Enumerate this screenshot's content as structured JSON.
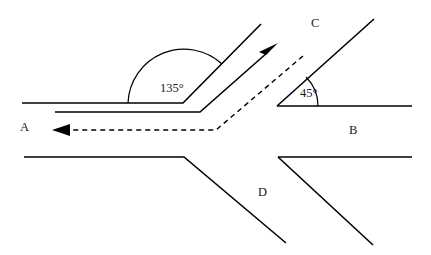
{
  "figure": {
    "type": "geometry-diagram",
    "background_color": "#ffffff",
    "stroke_color": "#000000",
    "width": 431,
    "height": 255
  },
  "angles": [
    {
      "id": "angle-135",
      "label": "135°",
      "value": 135,
      "unit": "degrees",
      "vertex": [
        183,
        103
      ],
      "label_position": [
        160,
        92
      ],
      "arc_radius": 56
    },
    {
      "id": "angle-45",
      "label": "45°",
      "value": 45,
      "unit": "degrees",
      "vertex": [
        277,
        106
      ],
      "label_position": [
        300,
        97
      ],
      "arc_radius": 40
    }
  ],
  "region_labels": [
    {
      "id": "label-a",
      "text": "A",
      "x": 20,
      "y": 131
    },
    {
      "id": "label-b",
      "text": "B",
      "x": 349,
      "y": 134
    },
    {
      "id": "label-c",
      "text": "C",
      "x": 311,
      "y": 27
    },
    {
      "id": "label-d",
      "text": "D",
      "x": 258,
      "y": 196
    }
  ],
  "paths": {
    "upper_left_bent_line": "M 22 103 L 183 103 L 261 24",
    "second_bent_line": "M 55 112 L 200 112 L 268 52",
    "lower_left_line": "M 24 157 L 184 157 L 286 243",
    "right_horizontal_line": "M 277 106 L 412 106",
    "right_upper_diagonal": "M 277 106 L 374 19",
    "right_lower_horizontal": "M 278 157 L 412 157",
    "right_lower_diagonal": "M 278 157 L 373 245",
    "dashed_path": "M 303 56 L 216 130 L 62 130",
    "arc_135": "M 128 103 A 56 56 0 0 1 222 64",
    "arc_45": "M 318 106 A 41 41 0 0 0 306 77"
  },
  "arrowheads": [
    {
      "id": "solid-arrow-up-right",
      "direction": "up-right",
      "tip": [
        278,
        43
      ],
      "points": "278,43 259,52 266,55 261,60"
    },
    {
      "id": "dashed-arrow-left",
      "direction": "left",
      "tip": [
        52,
        130
      ],
      "points": "52,130 70,124 70,136"
    }
  ]
}
